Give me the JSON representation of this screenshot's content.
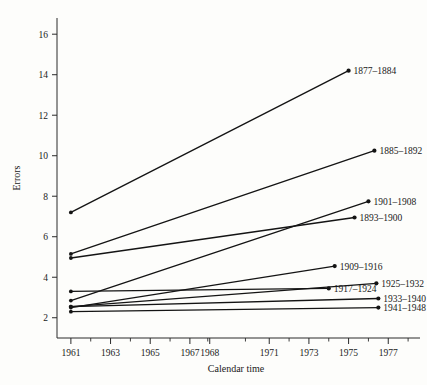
{
  "chart_data": {
    "type": "line",
    "title": "",
    "xlabel": "Calendar time",
    "ylabel": "Errors",
    "xlim": [
      1960.3,
      1978.6
    ],
    "ylim": [
      1.0,
      16.8
    ],
    "grid": false,
    "legend_position": "right-inline-labels",
    "x_ticks_major": [
      1961,
      1963,
      1965,
      1967,
      1968,
      1971,
      1973,
      1975,
      1977
    ],
    "x_tick_labels": [
      "1961",
      "1963",
      "1965",
      "1967",
      "1968",
      "1971",
      "1973",
      "1975",
      "1977"
    ],
    "x_ticks_minor": [
      1962,
      1964,
      1966,
      1967.9,
      1969.8,
      1972,
      1974,
      1976,
      1978
    ],
    "y_ticks": [
      2,
      4,
      6,
      8,
      10,
      12,
      14,
      16
    ],
    "y_tick_labels": [
      "2",
      "4",
      "6",
      "8",
      "10",
      "12",
      "14",
      "16"
    ],
    "series": [
      {
        "name": "1877-1884",
        "label": "1877–1884",
        "x": [
          1961,
          1975.0
        ],
        "values": [
          7.2,
          14.2
        ]
      },
      {
        "name": "1885-1892",
        "label": "1885–1892",
        "x": [
          1961,
          1976.3
        ],
        "values": [
          5.15,
          10.25
        ]
      },
      {
        "name": "1901-1908",
        "label": "1901–1908",
        "x": [
          1961,
          1976.0
        ],
        "values": [
          2.85,
          7.75
        ]
      },
      {
        "name": "1893-1900",
        "label": "1893–1900",
        "x": [
          1961,
          1975.3
        ],
        "values": [
          4.95,
          6.95
        ]
      },
      {
        "name": "1909-1916",
        "label": "1909–1916",
        "x": [
          1961,
          1974.3
        ],
        "values": [
          2.5,
          4.55
        ]
      },
      {
        "name": "1925-1932",
        "label": "1925–1932",
        "x": [
          1961,
          1976.4
        ],
        "values": [
          2.55,
          3.7
        ]
      },
      {
        "name": "1917-1924",
        "label": "1917–1924",
        "x": [
          1961,
          1974.0
        ],
        "values": [
          3.3,
          3.45
        ]
      },
      {
        "name": "1933-1940",
        "label": "1933–1940",
        "x": [
          1961,
          1976.5
        ],
        "values": [
          2.55,
          2.95
        ]
      },
      {
        "name": "1941-1948",
        "label": "1941–1948",
        "x": [
          1961,
          1976.5
        ],
        "values": [
          2.3,
          2.5
        ]
      }
    ]
  },
  "colors": {
    "line": "#141414",
    "axis": "#2a2a2a",
    "background": "#fdfdfb",
    "text": "#1a1a1a"
  }
}
